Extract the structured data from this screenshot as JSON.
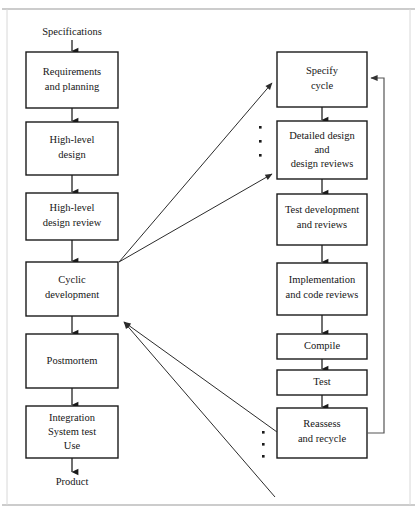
{
  "figure": {
    "colors": {
      "box_stroke": "#1a1a1a",
      "box_fill": "#ffffff",
      "text": "#161616",
      "arrow": "#1a1a1a",
      "diagonal_arrow": "#2b2b2b",
      "feedback_loop": "#555555",
      "frame": "#9a9a9a"
    }
  },
  "labels": {
    "start": "Specifications",
    "end": "Product"
  },
  "left_column": {
    "name": "main-process-column",
    "boxes": [
      {
        "id": "requirements-and-planning",
        "lines": [
          "Requirements",
          "and planning"
        ]
      },
      {
        "id": "high-level-design",
        "lines": [
          "High-level",
          "design"
        ]
      },
      {
        "id": "high-level-design-review",
        "lines": [
          "High-level",
          "design review"
        ]
      },
      {
        "id": "cyclic-development",
        "lines": [
          "Cyclic",
          "development"
        ]
      },
      {
        "id": "postmortem",
        "lines": [
          "Postmortem"
        ]
      },
      {
        "id": "integration-system-test-use",
        "lines": [
          "Integration",
          "System test",
          "Use"
        ]
      }
    ]
  },
  "right_column": {
    "name": "cycle-detail-column",
    "boxes": [
      {
        "id": "specify-cycle",
        "lines": [
          "Specify",
          "cycle"
        ]
      },
      {
        "id": "detailed-design-and-design-reviews",
        "lines": [
          "Detailed design",
          "and",
          "design reviews"
        ]
      },
      {
        "id": "test-development-and-reviews",
        "lines": [
          "Test development",
          "and reviews"
        ]
      },
      {
        "id": "implementation-and-code-reviews",
        "lines": [
          "Implementation",
          "and code reviews"
        ]
      },
      {
        "id": "compile",
        "lines": [
          "Compile"
        ]
      },
      {
        "id": "test",
        "lines": [
          "Test"
        ]
      },
      {
        "id": "reassess-and-recycle",
        "lines": [
          "Reassess",
          "and recycle"
        ]
      }
    ]
  },
  "connectors": {
    "expansion_arrows": [
      {
        "id": "cyclic-development-to-specify-cycle",
        "from": "cyclic-development",
        "to": "specify-cycle"
      },
      {
        "id": "cyclic-development-to-detailed-design",
        "from": "cyclic-development",
        "to": "detailed-design-and-design-reviews"
      }
    ],
    "return_arrows": [
      {
        "id": "reassess-to-cyclic-development",
        "from": "reassess-and-recycle",
        "to": "cyclic-development"
      },
      {
        "id": "cycle-continuation-to-cyclic-development",
        "from": "cycle-continuation",
        "to": "cyclic-development"
      }
    ],
    "feedback_loop": {
      "id": "reassess-to-specify-cycle-loop",
      "from": "reassess-and-recycle",
      "to": "specify-cycle"
    },
    "ellipses": [
      {
        "id": "ellipsis-upper",
        "dots": 3
      },
      {
        "id": "ellipsis-lower",
        "dots": 3
      }
    ]
  }
}
